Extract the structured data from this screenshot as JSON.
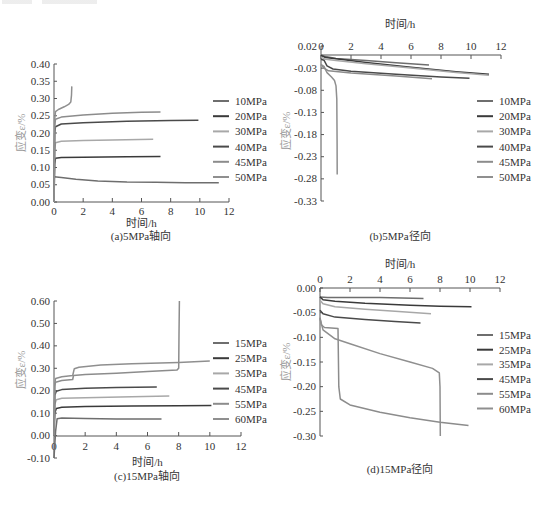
{
  "figure": {
    "header_text": ""
  },
  "chart_data": [
    {
      "id": "a",
      "type": "line",
      "caption": "(a)5MPa轴向",
      "title": "",
      "xlabel": "时间/h",
      "ylabel": "应变ε/%",
      "xlim": [
        0,
        12
      ],
      "ylim": [
        0,
        0.4
      ],
      "xticks": [
        0,
        2,
        4,
        6,
        8,
        10,
        12
      ],
      "yticks": [
        "0.00",
        "0.05",
        "0.10",
        "0.15",
        "0.20",
        "0.25",
        "0.30",
        "0.35",
        "0.40"
      ],
      "xaxis_position": "bottom",
      "grid": false,
      "legend_position": "right",
      "series": [
        {
          "name": "10MPa",
          "color": "#6e6e6e",
          "points": [
            [
              0,
              0.073
            ],
            [
              0.5,
              0.071
            ],
            [
              1.5,
              0.066
            ],
            [
              3,
              0.061
            ],
            [
              5,
              0.058
            ],
            [
              7,
              0.057
            ],
            [
              9,
              0.056
            ],
            [
              11.3,
              0.056
            ]
          ]
        },
        {
          "name": "20MPa",
          "color": "#3a3a3a",
          "points": [
            [
              0,
              0.0
            ],
            [
              0.05,
              0.11
            ],
            [
              0.1,
              0.127
            ],
            [
              0.5,
              0.129
            ],
            [
              2,
              0.13
            ],
            [
              5,
              0.131
            ],
            [
              7.3,
              0.132
            ]
          ]
        },
        {
          "name": "30MPa",
          "color": "#a8a8a8",
          "points": [
            [
              0,
              0.0
            ],
            [
              0.05,
              0.15
            ],
            [
              0.1,
              0.172
            ],
            [
              0.5,
              0.176
            ],
            [
              2,
              0.178
            ],
            [
              4,
              0.18
            ],
            [
              6.8,
              0.182
            ]
          ]
        },
        {
          "name": "40MPa",
          "color": "#4a4a4a",
          "points": [
            [
              0,
              0.0
            ],
            [
              0.05,
              0.2
            ],
            [
              0.1,
              0.218
            ],
            [
              0.5,
              0.226
            ],
            [
              2,
              0.23
            ],
            [
              5,
              0.234
            ],
            [
              8,
              0.236
            ],
            [
              9.9,
              0.237
            ]
          ]
        },
        {
          "name": "45MPa",
          "color": "#8c8c8c",
          "points": [
            [
              0,
              0.0
            ],
            [
              0.05,
              0.22
            ],
            [
              0.1,
              0.24
            ],
            [
              0.5,
              0.246
            ],
            [
              2,
              0.252
            ],
            [
              4,
              0.257
            ],
            [
              6,
              0.26
            ],
            [
              7.3,
              0.261
            ]
          ]
        },
        {
          "name": "50MPa",
          "color": "#8f8f8f",
          "points": [
            [
              0,
              0.0
            ],
            [
              0.05,
              0.24
            ],
            [
              0.1,
              0.262
            ],
            [
              0.3,
              0.268
            ],
            [
              0.7,
              0.276
            ],
            [
              1.0,
              0.283
            ],
            [
              1.15,
              0.29
            ],
            [
              1.2,
              0.31
            ],
            [
              1.22,
              0.335
            ]
          ]
        }
      ]
    },
    {
      "id": "b",
      "type": "line",
      "caption": "(b)5MPa径向",
      "title": "",
      "xlabel": "时间/h",
      "ylabel": "应变ε/%",
      "xlim": [
        0,
        12
      ],
      "ylim": [
        -0.33,
        0.02
      ],
      "xticks": [
        0,
        2,
        4,
        6,
        8,
        10,
        12
      ],
      "yticks": [
        "0.02",
        "-0.03",
        "-0.08",
        "-0.13",
        "-0.18",
        "-0.23",
        "-0.28",
        "-0.33"
      ],
      "xaxis_position": "top",
      "grid": false,
      "legend_position": "right",
      "series": [
        {
          "name": "10MPa",
          "color": "#6e6e6e",
          "points": [
            [
              0,
              0.0
            ],
            [
              0.3,
              -0.004
            ],
            [
              1,
              -0.008
            ],
            [
              3,
              -0.013
            ],
            [
              5,
              -0.018
            ],
            [
              7.2,
              -0.023
            ]
          ]
        },
        {
          "name": "20MPa",
          "color": "#3a3a3a",
          "points": [
            [
              0,
              -0.001
            ],
            [
              0.3,
              -0.006
            ],
            [
              1,
              -0.009
            ],
            [
              3,
              -0.017
            ],
            [
              6,
              -0.028
            ],
            [
              9,
              -0.038
            ],
            [
              11.2,
              -0.044
            ]
          ]
        },
        {
          "name": "30MPa",
          "color": "#a8a8a8",
          "points": [
            [
              0,
              -0.005
            ],
            [
              0.3,
              -0.01
            ],
            [
              1,
              -0.013
            ],
            [
              3,
              -0.02
            ],
            [
              6,
              -0.03
            ],
            [
              9,
              -0.04
            ],
            [
              11.2,
              -0.046
            ]
          ]
        },
        {
          "name": "40MPa",
          "color": "#4a4a4a",
          "points": [
            [
              0,
              -0.01
            ],
            [
              0.2,
              -0.012
            ],
            [
              0.4,
              -0.025
            ],
            [
              0.8,
              -0.032
            ],
            [
              2,
              -0.037
            ],
            [
              5,
              -0.044
            ],
            [
              8,
              -0.05
            ],
            [
              9.9,
              -0.053
            ]
          ]
        },
        {
          "name": "45MPa",
          "color": "#8c8c8c",
          "points": [
            [
              0,
              -0.022
            ],
            [
              0.2,
              -0.03
            ],
            [
              0.5,
              -0.036
            ],
            [
              2,
              -0.041
            ],
            [
              5,
              -0.048
            ],
            [
              7.4,
              -0.054
            ]
          ]
        },
        {
          "name": "50MPa",
          "color": "#8f8f8f",
          "points": [
            [
              0,
              -0.022
            ],
            [
              0.2,
              -0.026
            ],
            [
              0.4,
              -0.04
            ],
            [
              0.7,
              -0.05
            ],
            [
              0.9,
              -0.058
            ],
            [
              1.0,
              -0.07
            ],
            [
              1.05,
              -0.1
            ],
            [
              1.07,
              -0.2
            ],
            [
              1.08,
              -0.27
            ]
          ]
        }
      ]
    },
    {
      "id": "c",
      "type": "line",
      "caption": "(c)15MPa轴向",
      "title": "",
      "xlabel": "时间/h",
      "ylabel": "应变ε/%",
      "xlim": [
        0,
        12
      ],
      "ylim": [
        -0.1,
        0.6
      ],
      "xticks": [
        0,
        2,
        4,
        6,
        8,
        10,
        12
      ],
      "yticks": [
        "-0.10",
        "0.00",
        "0.10",
        "0.20",
        "0.30",
        "0.40",
        "0.50",
        "0.60"
      ],
      "xaxis_position": "zero",
      "grid": false,
      "legend_position": "right",
      "series": [
        {
          "name": "15MPa",
          "color": "#6e6e6e",
          "points": [
            [
              0,
              -0.1
            ],
            [
              0.1,
              0.02
            ],
            [
              0.2,
              0.075
            ],
            [
              0.5,
              0.078
            ],
            [
              2,
              0.076
            ],
            [
              4,
              0.074
            ],
            [
              6.9,
              0.074
            ]
          ]
        },
        {
          "name": "25MPa",
          "color": "#3a3a3a",
          "points": [
            [
              0,
              0.0
            ],
            [
              0.05,
              0.1
            ],
            [
              0.15,
              0.121
            ],
            [
              0.5,
              0.126
            ],
            [
              2,
              0.129
            ],
            [
              5,
              0.132
            ],
            [
              8,
              0.133
            ],
            [
              10.1,
              0.134
            ]
          ]
        },
        {
          "name": "35MPa",
          "color": "#a8a8a8",
          "points": [
            [
              0,
              0.0
            ],
            [
              0.05,
              0.14
            ],
            [
              0.15,
              0.16
            ],
            [
              0.5,
              0.166
            ],
            [
              2,
              0.169
            ],
            [
              5,
              0.173
            ],
            [
              7.4,
              0.176
            ]
          ]
        },
        {
          "name": "45MPa",
          "color": "#4a4a4a",
          "points": [
            [
              0,
              0.0
            ],
            [
              0.05,
              0.18
            ],
            [
              0.15,
              0.198
            ],
            [
              0.5,
              0.205
            ],
            [
              2,
              0.211
            ],
            [
              4,
              0.214
            ],
            [
              6.6,
              0.217
            ]
          ]
        },
        {
          "name": "55MPa",
          "color": "#8c8c8c",
          "points": [
            [
              0,
              0.0
            ],
            [
              0.05,
              0.22
            ],
            [
              0.1,
              0.238
            ],
            [
              0.5,
              0.245
            ],
            [
              1.2,
              0.25
            ],
            [
              1.25,
              0.268
            ],
            [
              2,
              0.272
            ],
            [
              4,
              0.278
            ],
            [
              6,
              0.285
            ],
            [
              7.9,
              0.293
            ],
            [
              8.0,
              0.3
            ],
            [
              8.02,
              0.45
            ],
            [
              8.05,
              0.6
            ]
          ]
        },
        {
          "name": "60MPa",
          "color": "#8f8f8f",
          "points": [
            [
              0,
              0.0
            ],
            [
              0.05,
              0.23
            ],
            [
              0.1,
              0.255
            ],
            [
              0.5,
              0.262
            ],
            [
              1.2,
              0.268
            ],
            [
              1.3,
              0.298
            ],
            [
              1.6,
              0.305
            ],
            [
              3,
              0.314
            ],
            [
              5,
              0.32
            ],
            [
              8,
              0.326
            ],
            [
              10,
              0.332
            ]
          ]
        }
      ]
    },
    {
      "id": "d",
      "type": "line",
      "caption": "(d)15MPa径向",
      "title": "",
      "xlabel": "时间/h",
      "ylabel": "应变ε/%",
      "xlim": [
        0,
        12
      ],
      "ylim": [
        -0.3,
        0.0
      ],
      "xticks": [
        0,
        2,
        4,
        6,
        8,
        10,
        12
      ],
      "yticks": [
        "0.00",
        "-0.05",
        "-0.10",
        "-0.15",
        "-0.20",
        "-0.25",
        "-0.30"
      ],
      "xaxis_position": "top",
      "grid": false,
      "legend_position": "right",
      "series": [
        {
          "name": "15MPa",
          "color": "#6e6e6e",
          "points": [
            [
              0,
              -0.018
            ],
            [
              0.5,
              -0.019
            ],
            [
              2,
              -0.019
            ],
            [
              4,
              -0.019
            ],
            [
              6.9,
              -0.021
            ]
          ]
        },
        {
          "name": "25MPa",
          "color": "#3a3a3a",
          "points": [
            [
              0,
              -0.018
            ],
            [
              0.2,
              -0.024
            ],
            [
              1,
              -0.027
            ],
            [
              3,
              -0.031
            ],
            [
              6,
              -0.035
            ],
            [
              8,
              -0.037
            ],
            [
              10.1,
              -0.038
            ]
          ]
        },
        {
          "name": "35MPa",
          "color": "#a8a8a8",
          "points": [
            [
              0,
              -0.025
            ],
            [
              0.2,
              -0.032
            ],
            [
              1,
              -0.038
            ],
            [
              3,
              -0.043
            ],
            [
              5,
              -0.047
            ],
            [
              7.4,
              -0.052
            ]
          ]
        },
        {
          "name": "45MPa",
          "color": "#4a4a4a",
          "points": [
            [
              0,
              -0.045
            ],
            [
              0.2,
              -0.052
            ],
            [
              1,
              -0.059
            ],
            [
              3,
              -0.064
            ],
            [
              5,
              -0.068
            ],
            [
              6.7,
              -0.071
            ]
          ]
        },
        {
          "name": "55MPa",
          "color": "#8c8c8c",
          "points": [
            [
              0,
              -0.06
            ],
            [
              0.1,
              -0.075
            ],
            [
              0.3,
              -0.08
            ],
            [
              1.2,
              -0.082
            ],
            [
              1.25,
              -0.2
            ],
            [
              1.35,
              -0.225
            ],
            [
              2,
              -0.237
            ],
            [
              4,
              -0.252
            ],
            [
              6,
              -0.263
            ],
            [
              8,
              -0.272
            ],
            [
              9.9,
              -0.279
            ]
          ]
        },
        {
          "name": "60MPa",
          "color": "#8f8f8f",
          "points": [
            [
              0,
              -0.062
            ],
            [
              0.2,
              -0.085
            ],
            [
              1,
              -0.103
            ],
            [
              2,
              -0.113
            ],
            [
              4,
              -0.133
            ],
            [
              6,
              -0.15
            ],
            [
              7.5,
              -0.163
            ],
            [
              7.95,
              -0.172
            ],
            [
              8.0,
              -0.2
            ],
            [
              8.02,
              -0.3
            ]
          ]
        }
      ]
    }
  ]
}
